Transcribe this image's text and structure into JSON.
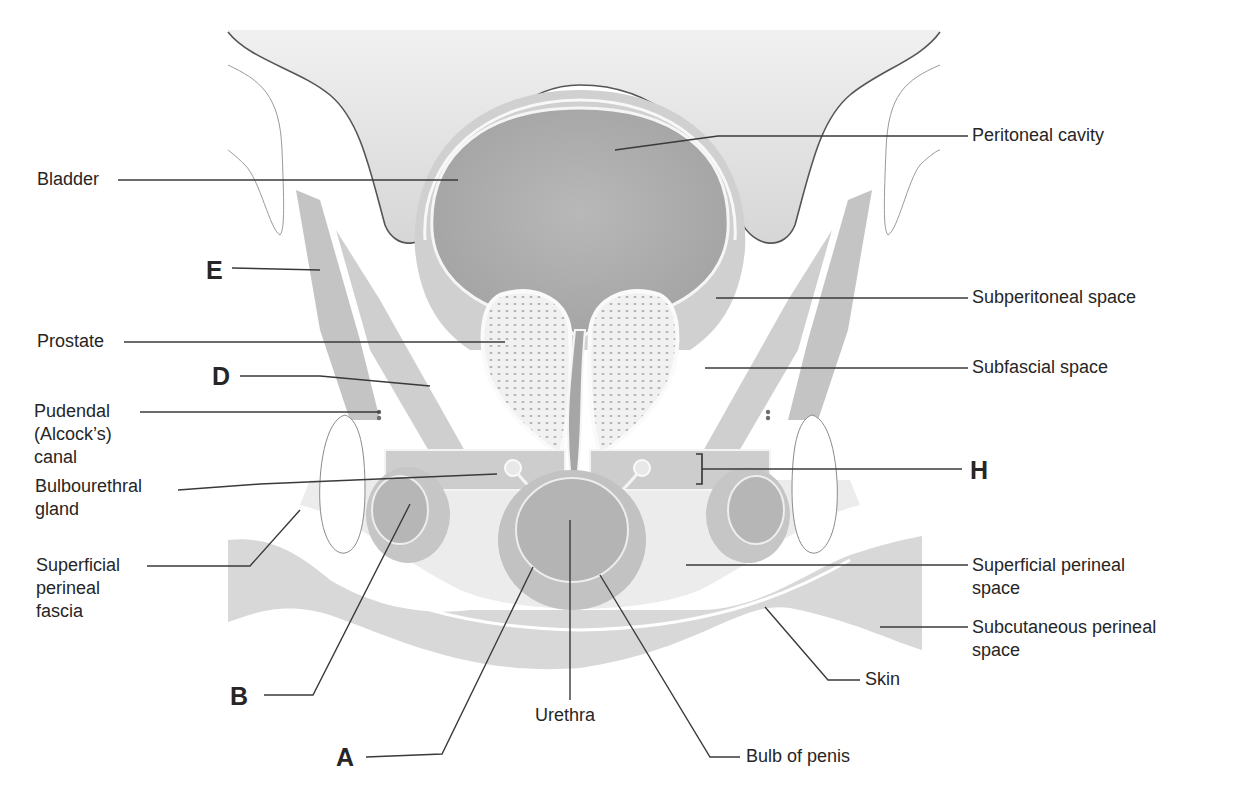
{
  "figure": {
    "type": "anatomical cross-section diagram",
    "colors": {
      "background": "#ffffff",
      "peritoneal_cavity": "#e0e0e0",
      "bladder_lumen": "#a9a9a9",
      "tissue": "#d2d2d2",
      "muscle": "#bcbcbc",
      "bone": "#ffffff",
      "outline": "#555555",
      "leader_line": "#3a3a3a",
      "label_text": "#262626"
    }
  },
  "labels": {
    "left": {
      "bladder": "Bladder",
      "prostate": "Prostate",
      "pudendal_canal": "Pudendal\n(Alcock’s)\ncanal",
      "bulbourethral_gland": "Bulbourethral\ngland",
      "superficial_perineal_fascia": "Superficial\nperineal\nfascia"
    },
    "right": {
      "peritoneal_cavity": "Peritoneal cavity",
      "subperitoneal_space": "Subperitoneal space",
      "subfascial_space": "Subfascial space",
      "superficial_perineal_space": "Superficial perineal\nspace",
      "subcutaneous_perineal_space": "Subcutaneous perineal\nspace"
    },
    "bottom": {
      "urethra": "Urethra",
      "skin": "Skin",
      "bulb_of_penis": "Bulb of penis"
    },
    "letters": {
      "E": "E",
      "D": "D",
      "H": "H",
      "B": "B",
      "A": "A"
    }
  }
}
